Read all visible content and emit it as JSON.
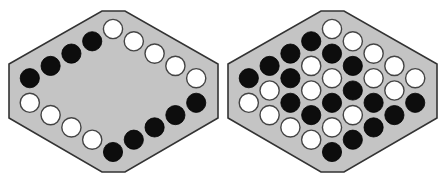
{
  "figure": {
    "background": "#ffffff",
    "board_fill": "#c4c4c4",
    "board_stroke": "#333333",
    "black_piece": "#0d0d0d",
    "white_piece": "#ffffff",
    "piece_outline": "#444444",
    "piece_radius": 9.6
  },
  "grid": {
    "rows": 6,
    "cols": 6,
    "excluded_cells": [
      [
        5,
        0
      ],
      [
        0,
        5
      ]
    ],
    "step_x": 20.8,
    "step_y": 12.3
  },
  "boards": [
    {
      "name": "left-board",
      "offset_x": 0,
      "top_cell": [
        113,
        29
      ],
      "outline": [
        [
          102,
          11
        ],
        [
          125,
          11
        ],
        [
          218,
          64
        ],
        [
          218,
          118
        ],
        [
          125,
          172
        ],
        [
          102,
          172
        ],
        [
          9,
          118
        ],
        [
          9,
          64
        ]
      ],
      "pieces": [
        {
          "i": 0,
          "j": 0,
          "color": "white"
        },
        {
          "i": 1,
          "j": 0,
          "color": "white"
        },
        {
          "i": 2,
          "j": 0,
          "color": "white"
        },
        {
          "i": 3,
          "j": 0,
          "color": "white"
        },
        {
          "i": 4,
          "j": 0,
          "color": "white"
        },
        {
          "i": 0,
          "j": 1,
          "color": "black"
        },
        {
          "i": 0,
          "j": 2,
          "color": "black"
        },
        {
          "i": 0,
          "j": 3,
          "color": "black"
        },
        {
          "i": 0,
          "j": 4,
          "color": "black"
        },
        {
          "i": 5,
          "j": 1,
          "color": "black"
        },
        {
          "i": 5,
          "j": 2,
          "color": "black"
        },
        {
          "i": 5,
          "j": 3,
          "color": "black"
        },
        {
          "i": 5,
          "j": 4,
          "color": "black"
        },
        {
          "i": 5,
          "j": 5,
          "color": "black"
        },
        {
          "i": 1,
          "j": 5,
          "color": "white"
        },
        {
          "i": 2,
          "j": 5,
          "color": "white"
        },
        {
          "i": 3,
          "j": 5,
          "color": "white"
        },
        {
          "i": 4,
          "j": 5,
          "color": "white"
        }
      ]
    },
    {
      "name": "right-board",
      "offset_x": 219,
      "top_cell": [
        113,
        29
      ],
      "outline": [
        [
          102,
          11
        ],
        [
          125,
          11
        ],
        [
          218,
          64
        ],
        [
          218,
          118
        ],
        [
          125,
          172
        ],
        [
          102,
          172
        ],
        [
          9,
          118
        ],
        [
          9,
          64
        ]
      ],
      "pieces": [
        {
          "i": 0,
          "j": 0,
          "color": "white"
        },
        {
          "i": 1,
          "j": 0,
          "color": "white"
        },
        {
          "i": 0,
          "j": 1,
          "color": "black"
        },
        {
          "i": 2,
          "j": 0,
          "color": "white"
        },
        {
          "i": 1,
          "j": 1,
          "color": "black"
        },
        {
          "i": 0,
          "j": 2,
          "color": "black"
        },
        {
          "i": 3,
          "j": 0,
          "color": "white"
        },
        {
          "i": 2,
          "j": 1,
          "color": "black"
        },
        {
          "i": 1,
          "j": 2,
          "color": "white"
        },
        {
          "i": 0,
          "j": 3,
          "color": "black"
        },
        {
          "i": 4,
          "j": 0,
          "color": "white"
        },
        {
          "i": 3,
          "j": 1,
          "color": "white"
        },
        {
          "i": 2,
          "j": 2,
          "color": "white"
        },
        {
          "i": 1,
          "j": 3,
          "color": "black"
        },
        {
          "i": 0,
          "j": 4,
          "color": "black"
        },
        {
          "i": 4,
          "j": 1,
          "color": "white"
        },
        {
          "i": 3,
          "j": 2,
          "color": "black"
        },
        {
          "i": 2,
          "j": 3,
          "color": "white"
        },
        {
          "i": 1,
          "j": 4,
          "color": "white"
        },
        {
          "i": 5,
          "j": 1,
          "color": "black"
        },
        {
          "i": 4,
          "j": 2,
          "color": "black"
        },
        {
          "i": 3,
          "j": 3,
          "color": "black"
        },
        {
          "i": 2,
          "j": 4,
          "color": "black"
        },
        {
          "i": 1,
          "j": 5,
          "color": "white"
        },
        {
          "i": 5,
          "j": 2,
          "color": "black"
        },
        {
          "i": 4,
          "j": 3,
          "color": "white"
        },
        {
          "i": 3,
          "j": 4,
          "color": "black"
        },
        {
          "i": 2,
          "j": 5,
          "color": "white"
        },
        {
          "i": 5,
          "j": 3,
          "color": "black"
        },
        {
          "i": 4,
          "j": 4,
          "color": "white"
        },
        {
          "i": 3,
          "j": 5,
          "color": "white"
        },
        {
          "i": 5,
          "j": 4,
          "color": "black"
        },
        {
          "i": 4,
          "j": 5,
          "color": "white"
        },
        {
          "i": 5,
          "j": 5,
          "color": "black"
        }
      ]
    }
  ]
}
